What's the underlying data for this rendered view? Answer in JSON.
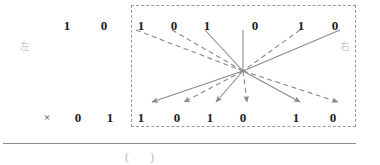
{
  "worksheet": {
    "title": "binary-multiplication-mapping-exercise",
    "left_label": "左",
    "right_label": "右",
    "operator": "×",
    "answer_parens": "( )"
  },
  "left_panel": {
    "top_row": {
      "label": "左",
      "label_x": 25,
      "label_y": 42,
      "digits": [
        {
          "value": "1",
          "x": 67,
          "y": 19
        },
        {
          "value": "0",
          "x": 104,
          "y": 19
        }
      ]
    },
    "bottom_row": {
      "operator": "×",
      "operator_x": 47,
      "operator_y": 112,
      "digits": [
        {
          "value": "0",
          "x": 78,
          "y": 111
        },
        {
          "value": "1",
          "x": 110,
          "y": 111
        }
      ]
    }
  },
  "boxed_panel": {
    "label": "右",
    "label_x": 345,
    "label_y": 42,
    "box": {
      "x": 131,
      "y": 5,
      "width": 225,
      "height": 122
    },
    "top_digits": [
      {
        "value": "1",
        "x": 141,
        "y": 19
      },
      {
        "value": "0",
        "x": 174,
        "y": 19
      },
      {
        "value": "1",
        "x": 207,
        "y": 19
      },
      {
        "value": "0",
        "x": 255,
        "y": 19
      },
      {
        "value": "1",
        "x": 301,
        "y": 19
      },
      {
        "value": "0",
        "x": 335,
        "y": 19
      }
    ],
    "bottom_digits": [
      {
        "value": "1",
        "x": 141,
        "y": 111
      },
      {
        "value": "0",
        "x": 177,
        "y": 111
      },
      {
        "value": "1",
        "x": 210,
        "y": 111
      },
      {
        "value": "0",
        "x": 243,
        "y": 111
      },
      {
        "value": "1",
        "x": 296,
        "y": 111
      },
      {
        "value": "0",
        "x": 333,
        "y": 111
      }
    ],
    "hub": {
      "x": 243,
      "y": 71
    },
    "connectors": [
      {
        "id": "c1",
        "style": "dashed",
        "from_x": 136,
        "from_y": 30,
        "to_x": 243,
        "to_y": 71,
        "arrow": false
      },
      {
        "id": "c2",
        "style": "dashed",
        "from_x": 172,
        "from_y": 30,
        "to_x": 243,
        "to_y": 71,
        "arrow": false
      },
      {
        "id": "c3",
        "style": "solid",
        "from_x": 205,
        "from_y": 30,
        "to_x": 243,
        "to_y": 71,
        "arrow": false
      },
      {
        "id": "c4",
        "style": "solid",
        "from_x": 243,
        "from_y": 30,
        "to_x": 243,
        "to_y": 71,
        "arrow": false
      },
      {
        "id": "c5",
        "style": "dashed",
        "from_x": 300,
        "from_y": 30,
        "to_x": 243,
        "to_y": 71,
        "arrow": false
      },
      {
        "id": "c6",
        "style": "solid",
        "from_x": 340,
        "from_y": 30,
        "to_x": 243,
        "to_y": 71,
        "arrow": false
      },
      {
        "id": "c7",
        "style": "solid",
        "from_x": 243,
        "from_y": 71,
        "to_x": 152,
        "to_y": 102,
        "arrow": true
      },
      {
        "id": "c8",
        "style": "dashed",
        "from_x": 243,
        "from_y": 71,
        "to_x": 184,
        "to_y": 102,
        "arrow": true
      },
      {
        "id": "c9",
        "style": "solid",
        "from_x": 243,
        "from_y": 71,
        "to_x": 216,
        "to_y": 102,
        "arrow": true
      },
      {
        "id": "c10",
        "style": "dashed",
        "from_x": 243,
        "from_y": 71,
        "to_x": 247,
        "to_y": 102,
        "arrow": true
      },
      {
        "id": "c11",
        "style": "solid",
        "from_x": 243,
        "from_y": 71,
        "to_x": 300,
        "to_y": 102,
        "arrow": true
      },
      {
        "id": "c12",
        "style": "dashed",
        "from_x": 243,
        "from_y": 71,
        "to_x": 338,
        "to_y": 102,
        "arrow": true
      }
    ]
  },
  "footer": {
    "rule": {
      "x": 3,
      "y": 143,
      "width": 353
    },
    "answer_parens": "(        )",
    "answer_x": 125,
    "answer_y": 151
  },
  "colors": {
    "ink": "#1b1b1b",
    "line": "#8e8e8e",
    "dash": "#9a9a9a",
    "faint": "#c9c9c9",
    "paper": "#ffffff"
  }
}
